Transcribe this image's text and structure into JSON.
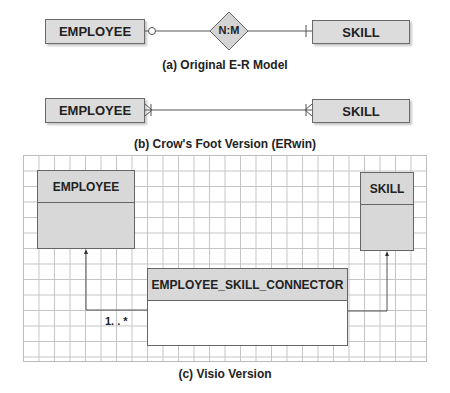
{
  "section_a": {
    "caption": "(a) Original E-R Model",
    "left_entity": "EMPLOYEE",
    "relationship": "N:M",
    "right_entity": "SKILL",
    "left_symbol": "optional-circle",
    "right_symbol": "mandatory-bar"
  },
  "section_b": {
    "caption": "(b) Crow's Foot Version (ERwin)",
    "left_entity": "EMPLOYEE",
    "right_entity": "SKILL",
    "left_symbol": "crows-foot-many",
    "right_symbol": "crows-foot-many"
  },
  "section_c": {
    "caption": "(c) Visio Version",
    "employee_table": "EMPLOYEE",
    "skill_table": "SKILL",
    "connector_table": "EMPLOYEE_SKILL_CONNECTOR",
    "multiplicity_label": "1. . *"
  },
  "colors": {
    "entity_fill": "#dcdcdc",
    "border": "#666666",
    "grid_line": "#c4c4c4"
  }
}
